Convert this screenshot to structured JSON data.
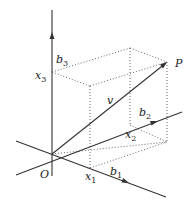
{
  "diagram": {
    "type": "3d-vector-decomposition",
    "labels": {
      "origin": "O",
      "point": "P",
      "vector": "v",
      "b1": {
        "base": "b",
        "sub": "1"
      },
      "b2": {
        "base": "b",
        "sub": "2"
      },
      "b3": {
        "base": "b",
        "sub": "3"
      },
      "x1": {
        "base": "x",
        "sub": "1"
      },
      "x2": {
        "base": "x",
        "sub": "2"
      },
      "x3": {
        "base": "x",
        "sub": "3"
      }
    },
    "colors": {
      "axis": "#333333",
      "dotted": "#555555",
      "text": "#222222"
    }
  }
}
